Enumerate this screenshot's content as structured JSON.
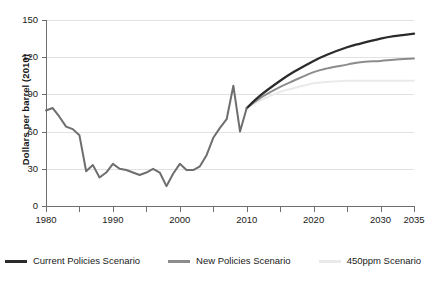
{
  "chart_data": {
    "type": "line",
    "title": "",
    "xlabel": "",
    "ylabel": "Dollars per barrel (2010)",
    "xlim": [
      1980,
      2035
    ],
    "ylim": [
      0,
      150
    ],
    "grid": true,
    "legend_position": "bottom",
    "y_ticks": [
      0,
      30,
      60,
      90,
      120,
      150
    ],
    "y_tick_labels": [
      "0",
      "30",
      "60",
      "90",
      "120",
      "150"
    ],
    "x_ticks": [
      1980,
      1985,
      1990,
      1995,
      2000,
      2005,
      2010,
      2015,
      2020,
      2025,
      2030,
      2035
    ],
    "x_tick_labels": [
      "1980",
      "1990",
      "2000",
      "2010",
      "2020",
      "2030",
      "2035"
    ],
    "x_labeled_ticks": [
      1980,
      1990,
      2000,
      2010,
      2020,
      2030,
      2035
    ],
    "colors": {
      "current_policies": "#2b2b2b",
      "new_policies": "#8c8c8c",
      "450ppm": "#eaeaea",
      "historical": "#6e6e6e",
      "axis": "#6e6e6e",
      "grid": "#e2e2e2",
      "text": "#1a1a1a"
    },
    "series": [
      {
        "name": "Historical",
        "color": "#6e6e6e",
        "x": [
          1980,
          1981,
          1982,
          1983,
          1984,
          1985,
          1986,
          1987,
          1988,
          1989,
          1990,
          1991,
          1992,
          1993,
          1994,
          1995,
          1996,
          1997,
          1998,
          1999,
          2000,
          2001,
          2002,
          2003,
          2004,
          2005,
          2006,
          2007,
          2008,
          2009,
          2010
        ],
        "values": [
          77,
          79,
          72,
          64,
          62,
          57,
          28,
          33,
          23,
          27,
          34,
          30,
          29,
          27,
          25,
          27,
          30,
          27,
          16,
          26,
          34,
          29,
          29,
          32,
          41,
          55,
          63,
          70,
          97,
          60,
          79
        ]
      },
      {
        "name": "Current Policies Scenario",
        "color": "#2b2b2b",
        "x": [
          2010,
          2012,
          2015,
          2017,
          2020,
          2022,
          2025,
          2027,
          2030,
          2032,
          2035
        ],
        "values": [
          79,
          89,
          101,
          108,
          117,
          122,
          128,
          131,
          135,
          137,
          139
        ]
      },
      {
        "name": "New Policies Scenario",
        "color": "#8c8c8c",
        "x": [
          2010,
          2012,
          2015,
          2017,
          2020,
          2022,
          2025,
          2027,
          2030,
          2032,
          2035
        ],
        "values": [
          79,
          87,
          96,
          101,
          108,
          111,
          114,
          116,
          117,
          118,
          119
        ]
      },
      {
        "name": "450ppm Scenario",
        "color": "#eaeaea",
        "x": [
          2010,
          2012,
          2015,
          2017,
          2020,
          2022,
          2025,
          2027,
          2030,
          2032,
          2035
        ],
        "values": [
          79,
          85,
          92,
          95,
          99,
          100,
          101,
          101,
          101,
          101,
          101
        ]
      }
    ]
  },
  "legend": {
    "items": [
      {
        "label": "Current Policies Scenario",
        "color": "#2b2b2b"
      },
      {
        "label": "New Policies Scenario",
        "color": "#8c8c8c"
      },
      {
        "label": "450ppm Scenario",
        "color": "#eaeaea"
      }
    ]
  }
}
